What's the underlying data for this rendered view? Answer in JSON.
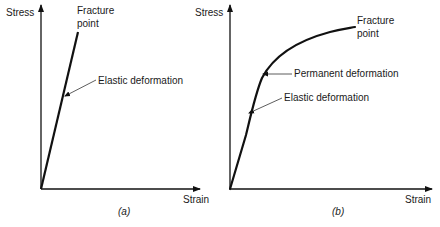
{
  "figure_a": {
    "y_axis_label": "Stress",
    "x_axis_label": "Strain",
    "fracture_label_line1": "Fracture",
    "fracture_label_line2": "point",
    "elastic_label": "Elastic deformation",
    "caption": "(a)"
  },
  "figure_b": {
    "y_axis_label": "Stress",
    "x_axis_label": "Strain",
    "fracture_label_line1": "Fracture",
    "fracture_label_line2": "point",
    "permanent_label": "Permanent deformation",
    "elastic_label": "Elastic deformation",
    "caption": "(b)"
  },
  "colors": {
    "line": "#111111",
    "text": "#1a1a1a",
    "background": "#ffffff"
  }
}
